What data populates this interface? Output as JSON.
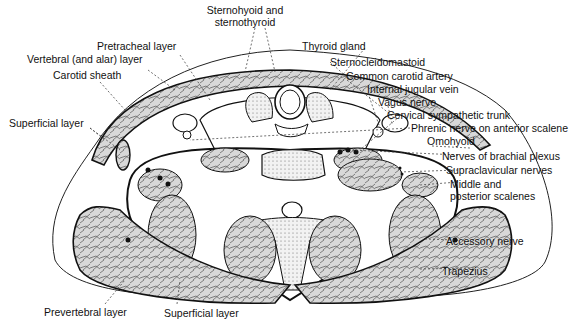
{
  "figure": {
    "labels_top": {
      "sternohyoid_line1": "Sternohyoid and",
      "sternohyoid_line2": "sternothyroid",
      "pretracheal": "Pretracheal layer",
      "vertebral": "Vertebral (and alar) layer",
      "carotid_sheath": "Carotid sheath",
      "superficial_left": "Superficial layer"
    },
    "labels_right": {
      "thyroid": "Thyroid gland",
      "scm": "Sternocleidomastoid",
      "carotid": "Common carotid artery",
      "ijv": "Internal jugular vein",
      "vagus": "Vagus nerve",
      "sympathetic": "Cervical sympathetic trunk",
      "phrenic": "Phrenic nerve on anterior scalene",
      "omohyoid": "Omohyoid",
      "brachial": "Nerves of brachial plexus",
      "supraclavicular": "Supraclavicular nerves",
      "scalenes_line1": "Middle and",
      "scalenes_line2": "posterior scalenes",
      "accessory": "Accessory nerve",
      "trapezius": "Trapezius"
    },
    "labels_bottom": {
      "prevertebral": "Prevertebral layer",
      "superficial_bottom": "Superficial layer"
    }
  }
}
